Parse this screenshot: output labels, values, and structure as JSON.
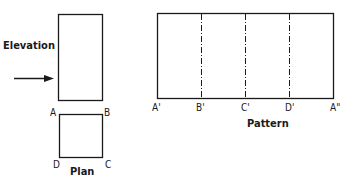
{
  "labels": {
    "elevation": "Elevation",
    "plan": "Plan",
    "pattern": "Pattern"
  },
  "plan_corners": {
    "a": "A",
    "b": "B",
    "c": "C",
    "d": "D"
  },
  "pattern_points": [
    "A'",
    "B'",
    "C'",
    "D'",
    "A\""
  ],
  "colors": {
    "stroke": "#1a1a1a",
    "background": "#ffffff"
  }
}
